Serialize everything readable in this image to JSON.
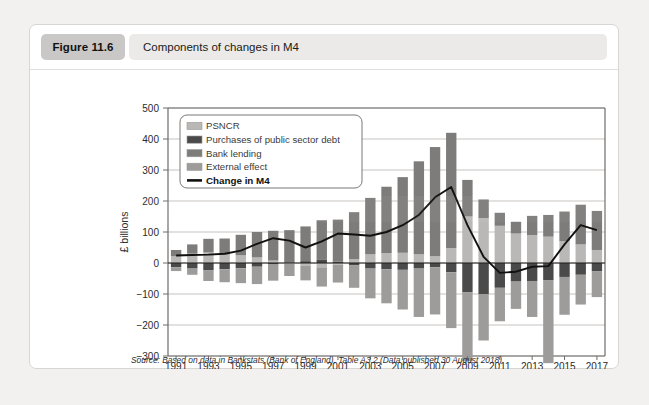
{
  "figure": {
    "badge": "Figure 11.6",
    "title": "Components of changes in M4",
    "source": "Source: Based on data in Bankstats (Bank of England), Table A3.2 (Data published 30 August 2018)"
  },
  "colors": {
    "psncr": "#b9b8b6",
    "purchases": "#4a4a4a",
    "bank_lending": "#7d7c7a",
    "external": "#9d9c9a",
    "change_line": "#111111",
    "badge_bg": "#c9c8c6",
    "title_bg": "#eceae8",
    "grid": "#c5c3c0",
    "card_bg": "#ffffff",
    "page_bg": "#f2f1ef"
  },
  "chart_data": {
    "type": "bar",
    "title": "Components of changes in M4",
    "xlabel": "",
    "ylabel": "£ billions",
    "ylim": [
      -300,
      500
    ],
    "ytick_step": 100,
    "yticks": [
      500,
      400,
      300,
      200,
      100,
      0,
      -100,
      -200,
      -300
    ],
    "grid": true,
    "legend_position": "top-left",
    "stacked": true,
    "categories": [
      1991,
      1992,
      1993,
      1994,
      1995,
      1996,
      1997,
      1998,
      1999,
      2000,
      2001,
      2002,
      2003,
      2004,
      2005,
      2006,
      2007,
      2008,
      2009,
      2010,
      2011,
      2012,
      2013,
      2014,
      2015,
      2016,
      2017
    ],
    "xtick_labels": [
      "1991",
      "1993",
      "1995",
      "1997",
      "1999",
      "2001",
      "2003",
      "2005",
      "2007",
      "2009",
      "2011",
      "2013",
      "2015",
      "2017"
    ],
    "series": [
      {
        "name": "PSNCR",
        "color": "#b9b8b6",
        "values": [
          22,
          30,
          34,
          27,
          25,
          18,
          8,
          -2,
          -8,
          -14,
          -5,
          12,
          28,
          32,
          33,
          28,
          22,
          48,
          150,
          145,
          120,
          95,
          90,
          85,
          70,
          60,
          42
        ]
      },
      {
        "name": "Purchases of public sector debt",
        "color": "#4a4a4a",
        "values": [
          -14,
          -18,
          -24,
          -20,
          -17,
          -12,
          -5,
          2,
          6,
          10,
          4,
          -8,
          -18,
          -20,
          -22,
          -18,
          -14,
          -30,
          -95,
          -100,
          -80,
          -60,
          -58,
          -55,
          -45,
          -38,
          -26
        ]
      },
      {
        "name": "Bank lending",
        "color": "#7d7c7a",
        "values": [
          20,
          30,
          44,
          52,
          66,
          82,
          96,
          104,
          112,
          128,
          136,
          152,
          182,
          214,
          244,
          300,
          352,
          372,
          118,
          60,
          42,
          38,
          62,
          70,
          96,
          128,
          126
        ]
      },
      {
        "name": "External effect",
        "color": "#9d9c9a",
        "values": [
          -12,
          -20,
          -34,
          -42,
          -48,
          -56,
          -52,
          -40,
          -48,
          -62,
          -58,
          -72,
          -96,
          -110,
          -128,
          -156,
          -152,
          -180,
          -222,
          -150,
          -108,
          -88,
          -116,
          -268,
          -122,
          -96,
          -84
        ]
      }
    ],
    "line_series": {
      "name": "Change in M4",
      "color": "#111111",
      "values": [
        24,
        26,
        27,
        30,
        40,
        62,
        80,
        72,
        50,
        70,
        95,
        92,
        88,
        100,
        122,
        155,
        212,
        245,
        122,
        20,
        -32,
        -28,
        -12,
        -10,
        60,
        122,
        106
      ]
    }
  },
  "legend": {
    "items": [
      {
        "label": "PSNCR",
        "swatch": "#b9b8b6",
        "type": "swatch"
      },
      {
        "label": "Purchases of public sector debt",
        "swatch": "#4a4a4a",
        "type": "swatch"
      },
      {
        "label": "Bank lending",
        "swatch": "#7d7c7a",
        "type": "swatch"
      },
      {
        "label": "External effect",
        "swatch": "#9d9c9a",
        "type": "swatch"
      },
      {
        "label": "Change in M4",
        "swatch": "#111111",
        "type": "line"
      }
    ]
  }
}
